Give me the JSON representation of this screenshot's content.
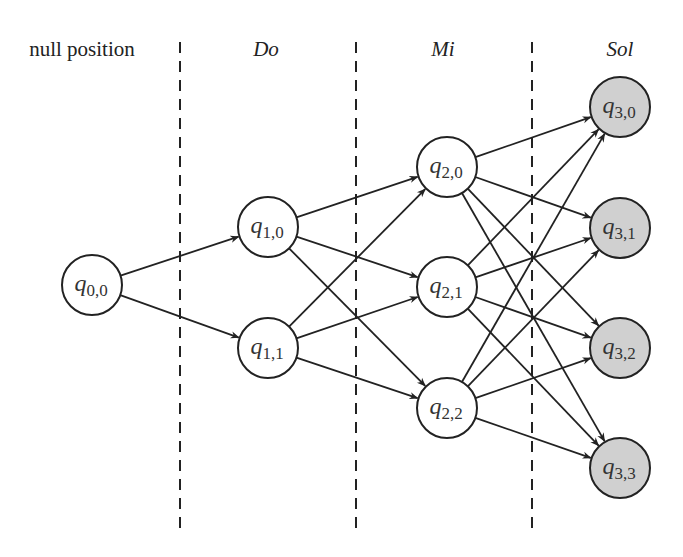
{
  "column_labels": [
    {
      "text": "null position",
      "x": 82,
      "italic": false
    },
    {
      "text": "Do",
      "x": 266,
      "italic": true
    },
    {
      "text": "Mi",
      "x": 443,
      "italic": true
    },
    {
      "text": "Sol",
      "x": 620,
      "italic": true
    }
  ],
  "dividers": [
    180,
    356,
    532
  ],
  "colors": {
    "stroke": "#222222",
    "node_fill": "#ffffff",
    "final_fill": "#d0d0d0"
  },
  "nodes": [
    {
      "id": "q00",
      "base": "q",
      "sub": "0,0",
      "x": 92,
      "y": 285,
      "final": false
    },
    {
      "id": "q10",
      "base": "q",
      "sub": "1,0",
      "x": 268,
      "y": 227,
      "final": false
    },
    {
      "id": "q11",
      "base": "q",
      "sub": "1,1",
      "x": 268,
      "y": 348,
      "final": false
    },
    {
      "id": "q20",
      "base": "q",
      "sub": "2,0",
      "x": 447,
      "y": 167,
      "final": false
    },
    {
      "id": "q21",
      "base": "q",
      "sub": "2,1",
      "x": 447,
      "y": 287,
      "final": false
    },
    {
      "id": "q22",
      "base": "q",
      "sub": "2,2",
      "x": 447,
      "y": 408,
      "final": false
    },
    {
      "id": "q30",
      "base": "q",
      "sub": "3,0",
      "x": 620,
      "y": 107,
      "final": true
    },
    {
      "id": "q31",
      "base": "q",
      "sub": "3,1",
      "x": 620,
      "y": 228,
      "final": true
    },
    {
      "id": "q32",
      "base": "q",
      "sub": "3,2",
      "x": 620,
      "y": 348,
      "final": true
    },
    {
      "id": "q33",
      "base": "q",
      "sub": "3,3",
      "x": 620,
      "y": 468,
      "final": true
    }
  ],
  "edges": [
    [
      "q00",
      "q10"
    ],
    [
      "q00",
      "q11"
    ],
    [
      "q10",
      "q20"
    ],
    [
      "q10",
      "q21"
    ],
    [
      "q10",
      "q22"
    ],
    [
      "q11",
      "q20"
    ],
    [
      "q11",
      "q21"
    ],
    [
      "q11",
      "q22"
    ],
    [
      "q20",
      "q30"
    ],
    [
      "q20",
      "q31"
    ],
    [
      "q20",
      "q32"
    ],
    [
      "q20",
      "q33"
    ],
    [
      "q21",
      "q30"
    ],
    [
      "q21",
      "q31"
    ],
    [
      "q21",
      "q32"
    ],
    [
      "q21",
      "q33"
    ],
    [
      "q22",
      "q30"
    ],
    [
      "q22",
      "q31"
    ],
    [
      "q22",
      "q32"
    ],
    [
      "q22",
      "q33"
    ]
  ]
}
